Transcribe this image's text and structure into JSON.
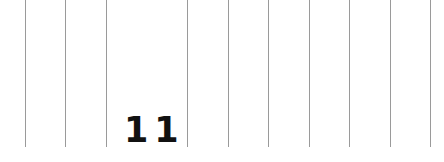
{
  "ruler": {
    "label": "11",
    "line_color": "#9a9a9a",
    "lines_x": [
      25,
      65,
      106,
      187,
      228,
      268,
      309,
      349,
      390,
      430
    ]
  }
}
